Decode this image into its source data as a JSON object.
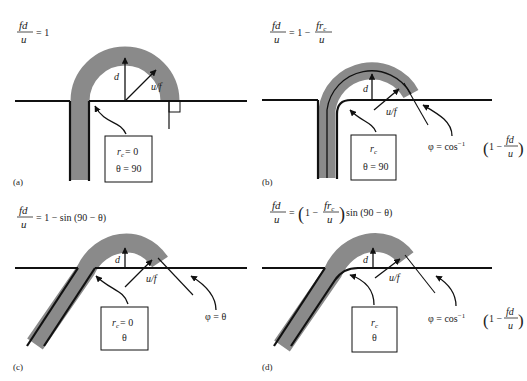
{
  "colors": {
    "band": "#8a8a8a",
    "line": "#111111",
    "background": "#ffffff"
  },
  "panels": [
    {
      "id": "a",
      "label": "(a)",
      "equation": {
        "lhs_num": "fd",
        "lhs_den": "u",
        "rhs": "= 1"
      },
      "box": {
        "line1_var": "r",
        "line1_sub": "c",
        "line1_rest": "= 0",
        "line2": "θ = 90"
      },
      "labels": {
        "d": "d",
        "uf": "u/f"
      }
    },
    {
      "id": "b",
      "label": "(b)",
      "equation": {
        "lhs_num": "fd",
        "lhs_den": "u",
        "rhs_pre": "= 1 −",
        "rhs_num_var": "fr",
        "rhs_num_sub": "c",
        "rhs_den": "u"
      },
      "box": {
        "line1_var": "r",
        "line1_sub": "c",
        "line2": "θ = 90"
      },
      "labels": {
        "d": "d",
        "uf": "u/f"
      },
      "phi": {
        "lhs": "φ = cos",
        "sup": "−1",
        "inner_pre": "1 −",
        "num": "fd",
        "den": "u"
      }
    },
    {
      "id": "c",
      "label": "(c)",
      "equation": {
        "lhs_num": "fd",
        "lhs_den": "u",
        "rhs": "= 1 − sin (90 − θ)"
      },
      "box": {
        "line1_var": "r",
        "line1_sub": "c",
        "line1_rest": "= 0",
        "line2": "θ"
      },
      "labels": {
        "d": "d",
        "uf": "u/f"
      },
      "phi": {
        "text": "φ = θ"
      }
    },
    {
      "id": "d",
      "label": "(d)",
      "equation": {
        "lhs_num": "fd",
        "lhs_den": "u",
        "rhs_pre": "= ",
        "inner_pre": "1 −",
        "rhs_num_var": "fr",
        "rhs_num_sub": "c",
        "rhs_den": "u",
        "rhs_post": "sin (90 − θ)"
      },
      "box": {
        "line1_var": "r",
        "line1_sub": "c",
        "line2": "θ"
      },
      "labels": {
        "d": "d",
        "uf": "u/f"
      },
      "phi": {
        "lhs": "φ = cos",
        "sup": "−1",
        "inner_pre": "1 −",
        "num": "fd",
        "den": "u"
      }
    }
  ]
}
